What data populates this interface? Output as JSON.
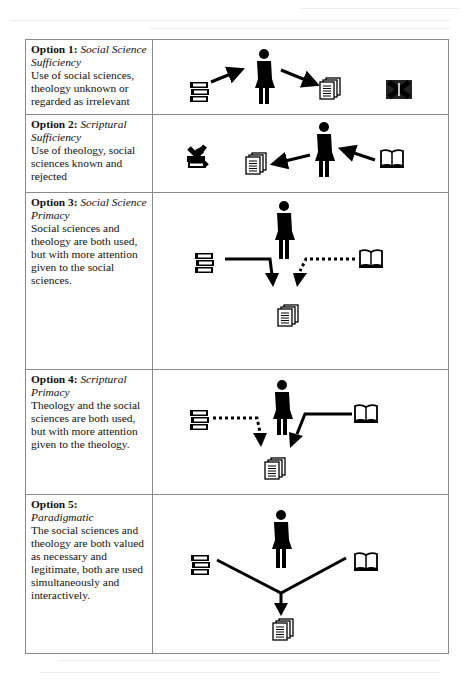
{
  "options": [
    {
      "number_label": "Option 1:",
      "name": "Social Science Sufficiency",
      "description": "Use of social sciences, theology unknown or regarded as irrelevant",
      "figure": {
        "icons": [
          "books-icon",
          "person-icon",
          "documents-icon",
          "crossed-out-book-icon"
        ],
        "arrows": "books → person → documents (solid); theology (bible) crossed out"
      }
    },
    {
      "number_label": "Option  2:",
      "name": "Scriptural Sufficiency",
      "description": "Use of theology, social sciences known and rejected",
      "figure": {
        "icons": [
          "crossed-out-books-icon",
          "documents-icon",
          "person-icon",
          "open-book-icon"
        ],
        "arrows": "open book → person → documents (solid); social sciences books crossed out"
      }
    },
    {
      "number_label": "Option  3:",
      "name": "Social Science Primacy",
      "description": "Social sciences and theology are both used, but with more attention given to the social sciences.",
      "figure": {
        "icons": [
          "books-icon",
          "person-icon",
          "open-book-icon",
          "documents-icon"
        ],
        "arrows": "books → documents (solid); open book → documents (dotted)"
      }
    },
    {
      "number_label": "Option 4:",
      "name": "Scriptural Primacy",
      "description": "Theology and the social sciences are both used, but with more attention given to the theology.",
      "figure": {
        "icons": [
          "books-icon",
          "person-icon",
          "open-book-icon",
          "documents-icon"
        ],
        "arrows": "books → documents (dotted); open book → documents (solid)"
      }
    },
    {
      "number_label": "Option 5:",
      "name": "Paradigmatic",
      "description": "The social sciences and theology are both valued as necessary and legitimate, both are used simultaneously and interactively.",
      "figure": {
        "icons": [
          "books-icon",
          "person-icon",
          "open-book-icon",
          "documents-icon"
        ],
        "arrows": "books and open book converge (solid V) → documents"
      }
    }
  ]
}
